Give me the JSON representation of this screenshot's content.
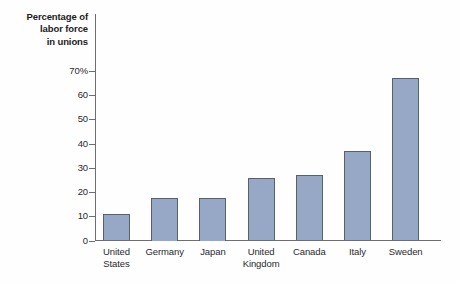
{
  "chart_data": {
    "type": "bar",
    "title": "",
    "ylabel": "Percentage of labor force in unions",
    "ylabel_lines": [
      "Percentage of",
      "labor force",
      "in unions"
    ],
    "xlabel": "",
    "categories": [
      "United States",
      "Germany",
      "Japan",
      "United Kingdom",
      "Canada",
      "Italy",
      "Sweden"
    ],
    "category_lines": [
      [
        "United",
        "States"
      ],
      [
        "Germany"
      ],
      [
        "Japan"
      ],
      [
        "United",
        "Kingdom"
      ],
      [
        "Canada"
      ],
      [
        "Italy"
      ],
      [
        "Sweden"
      ]
    ],
    "values": [
      11,
      17.5,
      17.5,
      26,
      27,
      37,
      67
    ],
    "ylim": [
      0,
      73
    ],
    "yticks": [
      0,
      10,
      20,
      30,
      40,
      50,
      60,
      70
    ],
    "ytick_labels": [
      "0",
      "10",
      "20",
      "30",
      "40",
      "50",
      "60",
      "70%"
    ],
    "grid": false,
    "legend": "none",
    "bar_color": "#97a7c6",
    "bar_border_color": "#5b5f6a",
    "axis_color": "#6e6e70",
    "background_color": "#fefeff"
  }
}
